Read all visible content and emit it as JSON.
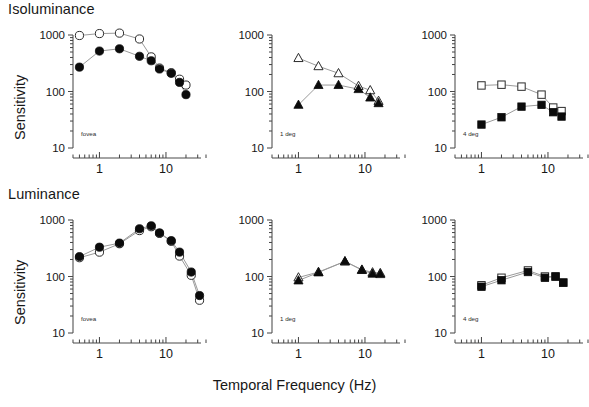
{
  "figure": {
    "x_axis_title": "Temporal Frequency (Hz)",
    "y_axis_title": "Sensitivity",
    "row_titles": {
      "top": "Isoluminance",
      "bottom": "Luminance"
    },
    "y_tick_labels": [
      "1000",
      "100",
      "10"
    ],
    "x_tick_labels": [
      "1",
      "10"
    ],
    "eccentricity_notes": [
      "fovea",
      "1 deg",
      "4 deg"
    ],
    "colors": {
      "filled_marker": "#0b0b0b",
      "open_marker_fill": "#ffffff",
      "open_marker_stroke": "#2b2b2b",
      "connector_line": "#9a9a9a",
      "axis": "#4a4a4a",
      "text": "#171717",
      "background": "#ffffff"
    }
  },
  "chart_data": [
    {
      "type": "scatter",
      "panel_id": "isoluminance-fovea",
      "title": "Isoluminance",
      "note": "fovea",
      "xlabel": "Temporal Frequency (Hz)",
      "ylabel": "Sensitivity",
      "xscale": "log",
      "yscale": "log",
      "xlim": [
        0.4,
        40
      ],
      "ylim": [
        10,
        1000
      ],
      "xticks": [
        1,
        10
      ],
      "yticks": [
        10,
        100,
        1000
      ],
      "grid": false,
      "legend": "none",
      "series": [
        {
          "name": "open-circle",
          "marker": "circle-open",
          "x": [
            0.5,
            1,
            2,
            4,
            6,
            8,
            12,
            16,
            20
          ],
          "y": [
            980,
            1060,
            1080,
            850,
            410,
            260,
            215,
            165,
            130
          ]
        },
        {
          "name": "filled-circle",
          "marker": "circle-filled",
          "x": [
            0.5,
            1,
            2,
            4,
            6,
            8,
            12,
            16,
            20
          ],
          "y": [
            270,
            520,
            570,
            420,
            350,
            250,
            210,
            145,
            88
          ]
        }
      ]
    },
    {
      "type": "scatter",
      "panel_id": "isoluminance-1deg",
      "title": "Isoluminance",
      "note": "1 deg",
      "xlabel": "Temporal Frequency (Hz)",
      "ylabel": "Sensitivity",
      "xscale": "log",
      "yscale": "log",
      "xlim": [
        0.4,
        40
      ],
      "ylim": [
        10,
        1000
      ],
      "xticks": [
        1,
        10
      ],
      "yticks": [
        10,
        100,
        1000
      ],
      "grid": false,
      "legend": "none",
      "series": [
        {
          "name": "open-triangle",
          "marker": "triangle-open",
          "x": [
            1,
            2,
            4,
            8,
            12,
            16
          ],
          "y": [
            390,
            280,
            210,
            125,
            105,
            68
          ]
        },
        {
          "name": "filled-triangle",
          "marker": "triangle-filled",
          "x": [
            1,
            2,
            4,
            8,
            12,
            16
          ],
          "y": [
            58,
            130,
            130,
            110,
            78,
            62
          ]
        }
      ]
    },
    {
      "type": "scatter",
      "panel_id": "isoluminance-4deg",
      "title": "Isoluminance",
      "note": "4 deg",
      "xlabel": "Temporal Frequency (Hz)",
      "ylabel": "Sensitivity",
      "xscale": "log",
      "yscale": "log",
      "xlim": [
        0.4,
        40
      ],
      "ylim": [
        10,
        1000
      ],
      "xticks": [
        1,
        10
      ],
      "yticks": [
        10,
        100,
        1000
      ],
      "grid": false,
      "legend": "none",
      "series": [
        {
          "name": "open-square",
          "marker": "square-open",
          "x": [
            1,
            2,
            4,
            8,
            12,
            16
          ],
          "y": [
            128,
            132,
            122,
            88,
            52,
            45
          ]
        },
        {
          "name": "filled-square",
          "marker": "square-filled",
          "x": [
            1,
            2,
            4,
            8,
            12,
            16
          ],
          "y": [
            26,
            35,
            54,
            58,
            43,
            36
          ]
        }
      ]
    },
    {
      "type": "scatter",
      "panel_id": "luminance-fovea",
      "title": "Luminance",
      "note": "fovea",
      "xlabel": "Temporal Frequency (Hz)",
      "ylabel": "Sensitivity",
      "xscale": "log",
      "yscale": "log",
      "xlim": [
        0.4,
        40
      ],
      "ylim": [
        10,
        1000
      ],
      "xticks": [
        1,
        10
      ],
      "yticks": [
        10,
        100,
        1000
      ],
      "grid": false,
      "legend": "none",
      "series": [
        {
          "name": "open-circle",
          "marker": "circle-open",
          "x": [
            0.5,
            1,
            2,
            4,
            6,
            8,
            12,
            16,
            24,
            32
          ],
          "y": [
            215,
            270,
            380,
            650,
            760,
            580,
            420,
            230,
            105,
            38
          ]
        },
        {
          "name": "filled-circle",
          "marker": "circle-filled",
          "x": [
            0.5,
            1,
            2,
            4,
            6,
            8,
            12,
            16,
            24,
            32
          ],
          "y": [
            225,
            330,
            390,
            700,
            790,
            590,
            430,
            270,
            120,
            46
          ]
        }
      ]
    },
    {
      "type": "scatter",
      "panel_id": "luminance-1deg",
      "title": "Luminance",
      "note": "1 deg",
      "xlabel": "Temporal Frequency (Hz)",
      "ylabel": "Sensitivity",
      "xscale": "log",
      "yscale": "log",
      "xlim": [
        0.4,
        40
      ],
      "ylim": [
        10,
        1000
      ],
      "xticks": [
        1,
        10
      ],
      "yticks": [
        10,
        100,
        1000
      ],
      "grid": false,
      "legend": "none",
      "series": [
        {
          "name": "open-triangle",
          "marker": "triangle-open",
          "x": [
            1,
            2,
            5,
            9,
            13,
            17
          ],
          "y": [
            96,
            120,
            185,
            132,
            118,
            115
          ]
        },
        {
          "name": "filled-triangle",
          "marker": "triangle-filled",
          "x": [
            1,
            2,
            5,
            9,
            13,
            17
          ],
          "y": [
            85,
            118,
            185,
            130,
            112,
            110
          ]
        }
      ]
    },
    {
      "type": "scatter",
      "panel_id": "luminance-4deg",
      "title": "Luminance",
      "note": "4 deg",
      "xlabel": "Temporal Frequency (Hz)",
      "ylabel": "Sensitivity",
      "xscale": "log",
      "yscale": "log",
      "xlim": [
        0.4,
        40
      ],
      "ylim": [
        10,
        1000
      ],
      "xticks": [
        1,
        10
      ],
      "yticks": [
        10,
        100,
        1000
      ],
      "grid": false,
      "legend": "none",
      "series": [
        {
          "name": "open-square",
          "marker": "square-open",
          "x": [
            1,
            2,
            5,
            9,
            13,
            17
          ],
          "y": [
            70,
            95,
            128,
            100,
            100,
            78
          ]
        },
        {
          "name": "filled-square",
          "marker": "square-filled",
          "x": [
            1,
            2,
            5,
            9,
            13,
            17
          ],
          "y": [
            66,
            86,
            120,
            95,
            100,
            78
          ]
        }
      ]
    }
  ]
}
